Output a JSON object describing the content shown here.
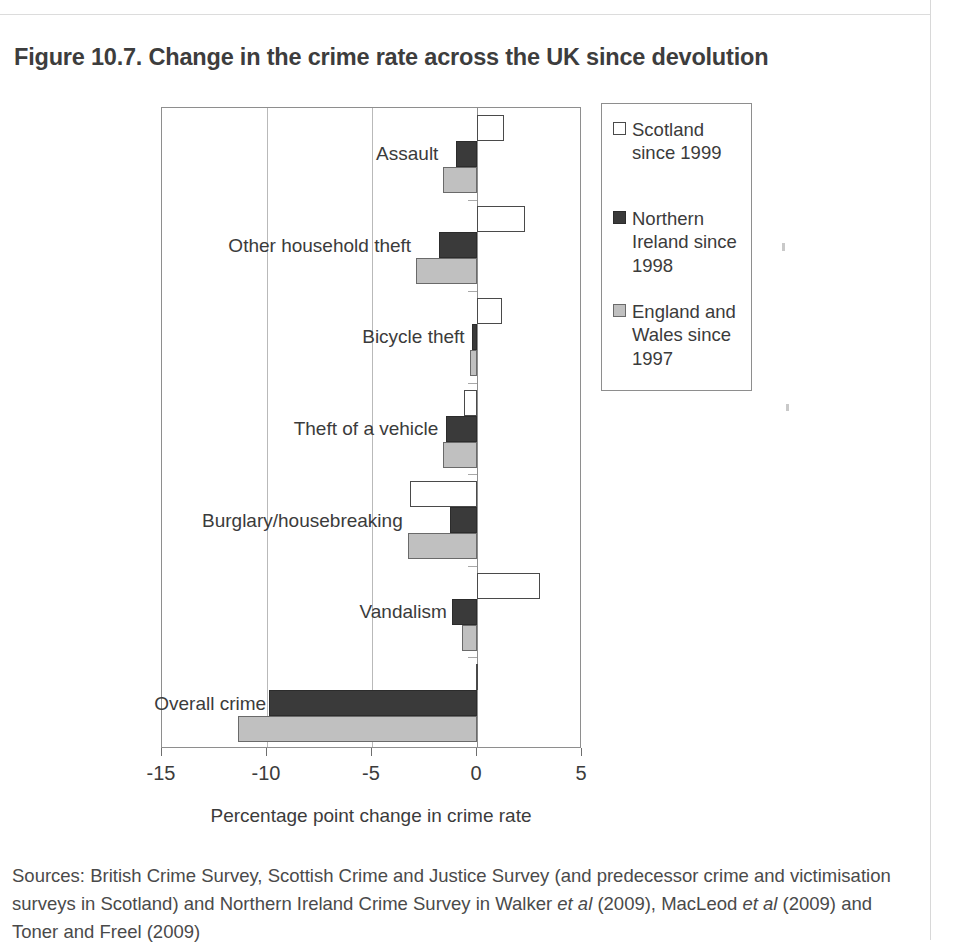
{
  "figure": {
    "title": "Figure 10.7. Change in the crime rate across the UK since devolution"
  },
  "chart_data": {
    "type": "bar",
    "orientation": "horizontal",
    "title": "Figure 10.7. Change in the crime rate across the UK since devolution",
    "xlabel": "Percentage point change in crime rate",
    "ylabel": "",
    "xlim": [
      -15,
      5
    ],
    "xticks": [
      -15,
      -10,
      -5,
      0,
      5
    ],
    "xtick_labels": [
      "-15",
      "-10",
      "-5",
      "0",
      "5"
    ],
    "grid": true,
    "legend_position": "right",
    "categories": [
      "Assault",
      "Other household theft",
      "Bicycle theft",
      "Theft of a vehicle",
      "Burglary/housebreaking",
      "Vandalism",
      "Overall crime"
    ],
    "series": [
      {
        "name": "Scotland since 1999",
        "color": "#ffffff",
        "values": [
          1.3,
          2.3,
          1.2,
          -0.6,
          -3.2,
          3.0,
          -0.05
        ]
      },
      {
        "name": "Northern Ireland since 1998",
        "color": "#3a3a3a",
        "values": [
          -1.0,
          -1.8,
          -0.25,
          -1.5,
          -1.3,
          -1.2,
          -9.9
        ]
      },
      {
        "name": "England and Wales since 1997",
        "color": "#c0c0c0",
        "values": [
          -1.6,
          -2.9,
          -0.35,
          -1.6,
          -3.3,
          -0.7,
          -11.4
        ]
      }
    ]
  },
  "legend": {
    "items": [
      {
        "label": "Scotland since 1999",
        "swatch": "scotland"
      },
      {
        "label": "Northern Ireland since 1998",
        "swatch": "northern-ireland"
      },
      {
        "label": "England and Wales since 1997",
        "swatch": "england-wales"
      }
    ]
  },
  "axis": {
    "title": "Percentage point change in crime rate",
    "tick_labels": [
      "-15",
      "-10",
      "-5",
      "0",
      "5"
    ]
  },
  "sources": {
    "line1_a": "Sources: British Crime Survey, Scottish Crime and Justice Survey (and predecessor crime and",
    "line2_a": "victimisation surveys in Scotland) and Northern Ireland Crime Survey in Walker ",
    "line2_em": "et al",
    "line2_b": " (2009), MacLeod",
    "line3_em": "et al",
    "line3_b": " (2009) and Toner and Freel (2009)"
  }
}
